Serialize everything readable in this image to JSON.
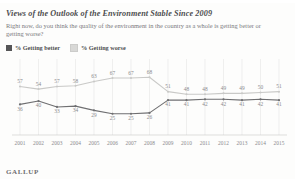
{
  "title": "Views of the Outlook of the Environment Stable Since 2009",
  "subtitle": "Right now, do you think the quality of the environment in the country as a whole is getting better or getting worse?",
  "legend": [
    {
      "label": "% Getting better",
      "color": "#555557"
    },
    {
      "label": "% Getting worse",
      "color": "#d8d8d6"
    }
  ],
  "footer": "GALLUP",
  "colors": {
    "better_line": "#6f6f71",
    "worse_line": "#c9c9c7",
    "grid": "#e6e6e4",
    "axis": "#d0d0ce",
    "label": "#8a8a8c"
  },
  "chart_data": {
    "type": "line",
    "title": "Views of the Outlook of the Environment Stable Since 2009",
    "xlabel": "",
    "ylabel": "",
    "ylim": [
      0,
      80
    ],
    "grid": true,
    "legend_position": "top-left",
    "categories": [
      "2001",
      "2002",
      "2003",
      "2004",
      "2005",
      "2006",
      "2007",
      "2008",
      "2009",
      "2010",
      "2011",
      "2012",
      "2013",
      "2014",
      "2015"
    ],
    "series": [
      {
        "name": "% Getting worse",
        "color": "#c9c9c7",
        "values": [
          57,
          54,
          57,
          58,
          63,
          67,
          67,
          68,
          51,
          48,
          48,
          49,
          49,
          50,
          51
        ]
      },
      {
        "name": "% Getting better",
        "color": "#6f6f71",
        "values": [
          36,
          40,
          33,
          34,
          29,
          25,
          25,
          26,
          41,
          41,
          42,
          42,
          41,
          42,
          41
        ]
      }
    ]
  }
}
